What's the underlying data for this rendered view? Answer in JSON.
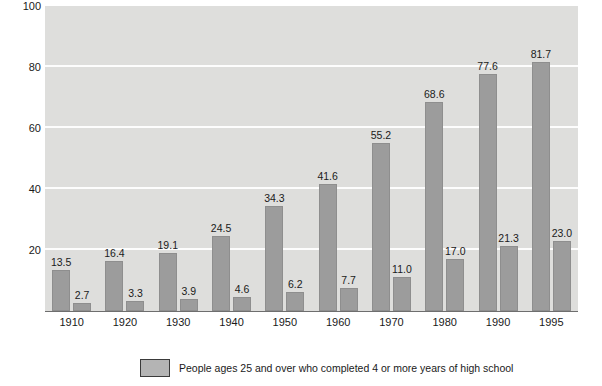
{
  "chart_data": {
    "type": "bar",
    "title": "",
    "subtitle": "",
    "xlabel": "",
    "ylabel": "Percent of population ages 25 and over",
    "categories": [
      "1910",
      "1920",
      "1930",
      "1940",
      "1950",
      "1960",
      "1970",
      "1980",
      "1990",
      "1995"
    ],
    "series": [
      {
        "name": "People ages 25 and over who completed 4 or more years of high school",
        "values": [
          13.5,
          16.4,
          19.1,
          24.5,
          34.3,
          41.6,
          55.2,
          68.6,
          77.6,
          81.7
        ],
        "labels": [
          "13.5",
          "16.4",
          "19.1",
          "24.5",
          "34.3",
          "41.6",
          "55.2",
          "68.6",
          "77.6",
          "81.7"
        ],
        "color": "#9c9c9c"
      },
      {
        "name": "",
        "values": [
          2.7,
          3.3,
          3.9,
          4.6,
          6.2,
          7.7,
          11.0,
          17.0,
          21.3,
          23.0
        ],
        "labels": [
          "2.7",
          "3.3",
          "3.9",
          "4.6",
          "6.2",
          "7.7",
          "11.0",
          "17.0",
          "21.3",
          "23.0"
        ],
        "color": "#9c9c9c"
      }
    ],
    "ylim": [
      0,
      100
    ],
    "yticks": [
      20,
      40,
      60,
      80,
      100
    ],
    "ytick_labels": [
      "20",
      "40",
      "60",
      "80",
      "100"
    ],
    "grid": true,
    "grid_color": "#fdfdfd",
    "plot_background": "#dededc",
    "legend_position": "bottom",
    "legend": [
      {
        "label": "People ages 25 and over who completed 4 or more years of high school",
        "color": "#b4b4b4"
      }
    ]
  }
}
